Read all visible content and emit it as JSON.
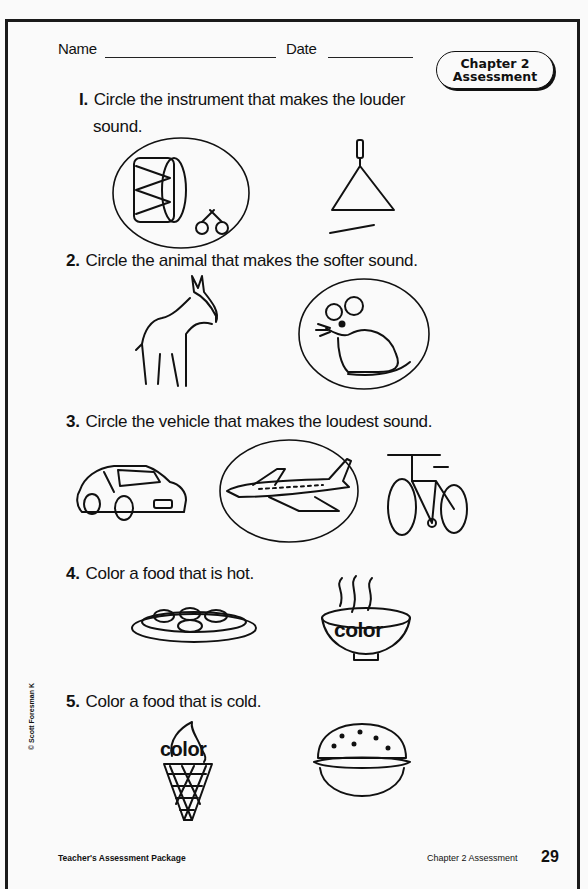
{
  "header": {
    "name_label": "Name",
    "date_label": "Date",
    "badge": {
      "line1": "Chapter 2",
      "line2": "Assessment"
    }
  },
  "questions": [
    {
      "number": "I.",
      "text_line1": "Circle the instrument that makes the louder",
      "text_line2": "sound.",
      "items": [
        {
          "icon": "drum-and-maracas-icon",
          "circled": true
        },
        {
          "icon": "triangle-instrument-icon",
          "circled": false
        }
      ]
    },
    {
      "number": "2.",
      "text": "Circle the animal that makes the softer sound.",
      "items": [
        {
          "icon": "donkey-icon",
          "circled": false
        },
        {
          "icon": "mouse-icon",
          "circled": true
        }
      ]
    },
    {
      "number": "3.",
      "text": "Circle the vehicle that makes the loudest sound.",
      "items": [
        {
          "icon": "car-icon",
          "circled": false
        },
        {
          "icon": "airplane-icon",
          "circled": true
        },
        {
          "icon": "bicycle-icon",
          "circled": false
        }
      ]
    },
    {
      "number": "4.",
      "text": "Color a food that is hot.",
      "items": [
        {
          "icon": "salad-plate-icon",
          "label": ""
        },
        {
          "icon": "hot-soup-bowl-icon",
          "label": "color"
        }
      ]
    },
    {
      "number": "5.",
      "text": "Color a food that is cold.",
      "items": [
        {
          "icon": "ice-cream-cone-icon",
          "label": "color"
        },
        {
          "icon": "hamburger-icon",
          "label": ""
        }
      ]
    }
  ],
  "footer": {
    "left": "Teacher's Assessment Package",
    "right": "Chapter 2 Assessment",
    "page_number": "29",
    "copyright": "© Scott Foresman K"
  }
}
